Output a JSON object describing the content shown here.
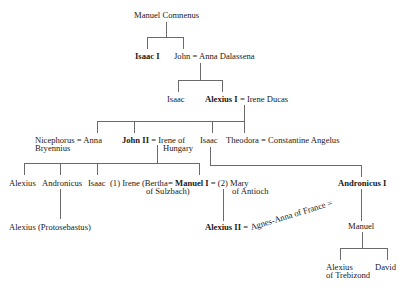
{
  "diagram": {
    "type": "genealogy",
    "nodes": {
      "manuel_comnenus": "Manuel Comnenus",
      "isaac_i": "Isaac I",
      "john": "John",
      "anna_dalassena": "Anna Dalassena",
      "isaac_gen3": "Isaac",
      "alexius_i": "Alexius I",
      "irene_ducas": "Irene Ducas",
      "nicephorus": "Nicephorus",
      "anna": "Anna",
      "bryennius": "Bryennius",
      "john_ii": "John II",
      "irene_of": "Irene of",
      "hungary": "Hungary",
      "isaac_gen4": "Isaac",
      "theodora": "Theodora",
      "constantine_angelus": "Constantine Angelus",
      "alexius_gen5": "Alexius",
      "andronicus_gen5": "Andronicus",
      "isaac_gen5": "Isaac",
      "irene_1": "(1) Irene (Bertha",
      "of_sulzbach": "of Sulzbach)",
      "manuel_i": "Manuel I",
      "mary_2": "(2) Mary",
      "of_antioch": "of Antioch",
      "andronicus_i": "Andronicus I",
      "alexius_protosebastus": "Alexius (Protosebastus)",
      "alexius_ii": "Alexius II",
      "agnes_anna": "Agnes-Anna of France",
      "manuel_gen6": "Manuel",
      "alexius_trebizond_1": "Alexius",
      "alexius_trebizond_2": "of Trebizond",
      "david": "David"
    },
    "marriage_symbol": "="
  }
}
